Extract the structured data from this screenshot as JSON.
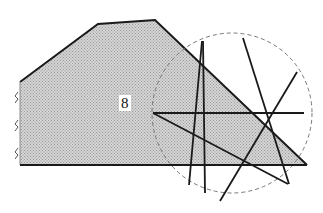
{
  "diagram": {
    "region_label": "8",
    "fill_color": "#c8c8c8",
    "stroke_color": "#1a1a1a",
    "circle_stroke": "#777777",
    "polygon": [
      [
        20,
        82
      ],
      [
        98,
        24
      ],
      [
        155,
        20
      ],
      [
        307,
        165
      ],
      [
        20,
        165
      ]
    ],
    "circle": {
      "cx": 232,
      "cy": 113,
      "r": 80
    },
    "lines": [
      {
        "x1": 20,
        "y1": 165,
        "x2": 307,
        "y2": 165
      },
      {
        "x1": 153,
        "y1": 113,
        "x2": 304,
        "y2": 113
      },
      {
        "x1": 153,
        "y1": 113,
        "x2": 288,
        "y2": 184
      },
      {
        "x1": 202,
        "y1": 41,
        "x2": 189,
        "y2": 185
      },
      {
        "x1": 203,
        "y1": 41,
        "x2": 205,
        "y2": 193
      },
      {
        "x1": 243,
        "y1": 38,
        "x2": 289,
        "y2": 184
      },
      {
        "x1": 297,
        "y1": 72,
        "x2": 220,
        "y2": 201
      }
    ],
    "wall_hatch_marks": [
      [
        16,
        97
      ],
      [
        16,
        125
      ],
      [
        16,
        153
      ]
    ]
  }
}
